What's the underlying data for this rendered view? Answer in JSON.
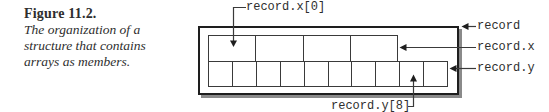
{
  "figure": {
    "label": "Figure 11.2.",
    "caption_lines": [
      "The organization of a",
      "structure that contains",
      "arrays as members."
    ]
  },
  "diagram": {
    "record_label": "record",
    "record_x_label": "record.x",
    "record_y_label": "record.y",
    "record_x0_label": "record.x[0]",
    "record_y8_label": "record.y[8]",
    "x_cell_count": 4,
    "y_cell_count": 10
  },
  "colors": {
    "line": "#3a3a3a",
    "outer_border": "#1e1e1e",
    "shadow": "#8a8a8a",
    "text": "#2e2e2e",
    "background": "#ffffff"
  }
}
